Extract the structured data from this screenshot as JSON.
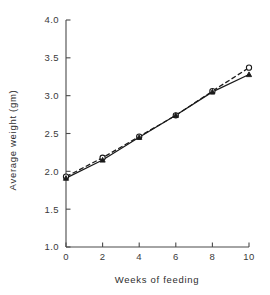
{
  "chart_data": {
    "type": "line",
    "title": "",
    "subtitle": "",
    "xlabel": "Weeks of feeding",
    "ylabel": "Average weight (gm)",
    "x": [
      0,
      2,
      4,
      6,
      8,
      10
    ],
    "xlim": [
      0,
      10
    ],
    "ylim": [
      1.0,
      4.0
    ],
    "xticks": [
      "0",
      "2",
      "4",
      "6",
      "8",
      "10"
    ],
    "yticks": [
      "1.0",
      "1.5",
      "2.0",
      "2.5",
      "3.0",
      "3.5",
      "4.0"
    ],
    "grid": false,
    "legend": "none",
    "annotations": [],
    "series": [
      {
        "name": "series-open-circle",
        "marker": "open-circle",
        "linestyle": "dashed",
        "color": "#1a1a1a",
        "values": [
          1.93,
          2.18,
          2.46,
          2.74,
          3.06,
          3.37
        ]
      },
      {
        "name": "series-filled-triangle",
        "marker": "filled-triangle",
        "linestyle": "solid",
        "color": "#1a1a1a",
        "values": [
          1.91,
          2.15,
          2.45,
          2.74,
          3.05,
          3.28
        ]
      }
    ]
  },
  "figure": {
    "caption": "",
    "background_color": "#ffffff",
    "axis_color": "#4a4a4a"
  }
}
